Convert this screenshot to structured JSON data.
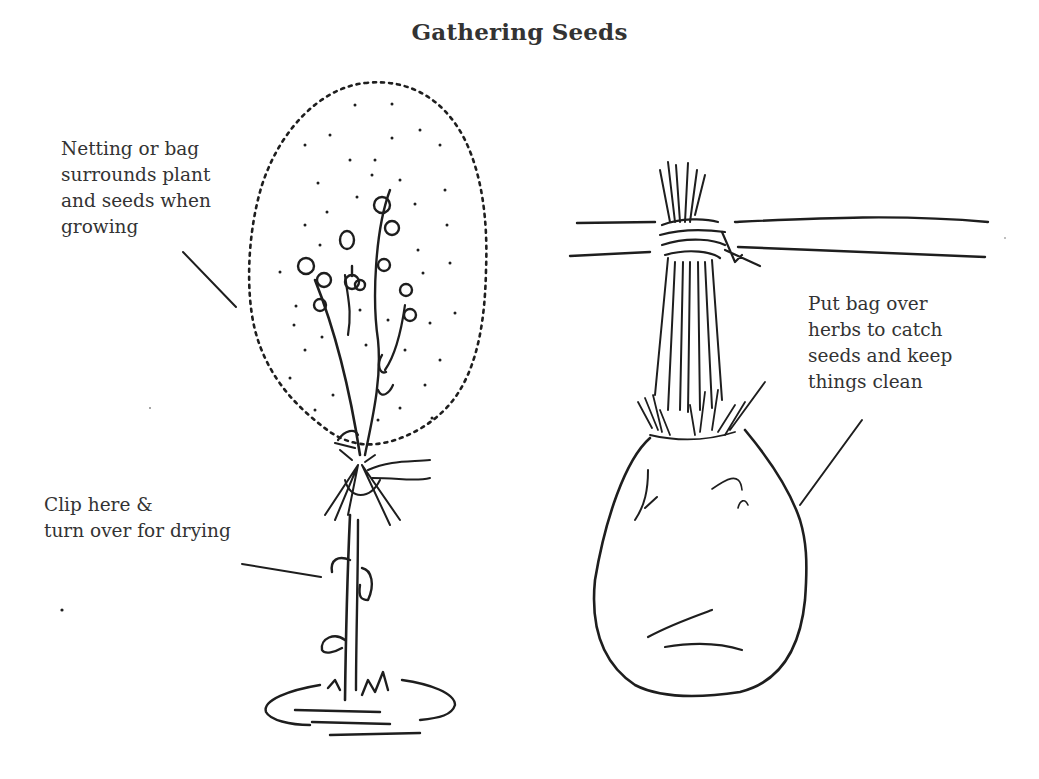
{
  "illustration": {
    "title": "Gathering Seeds",
    "captions": {
      "netting": {
        "lines": [
          "Netting or bag",
          "surrounds plant",
          "and seeds when",
          "growing"
        ]
      },
      "bag": {
        "lines": [
          "Put bag over",
          "herbs to catch",
          "seeds and keep",
          "things clean"
        ]
      },
      "clip": {
        "lines": [
          "Clip here &",
          "turn over for drying"
        ]
      }
    },
    "figures": [
      {
        "name": "netted-plant",
        "description": "growing plant with seed heads enclosed in dotted netting bag"
      },
      {
        "name": "hanging-bundle",
        "description": "herb bundle tied to a pole with bag over seed heads"
      }
    ],
    "colors": {
      "ink": "#1e1e1e",
      "background": "#ffffff"
    }
  }
}
